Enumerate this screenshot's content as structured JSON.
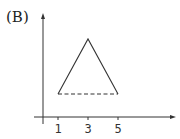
{
  "figure": {
    "label": "(B)",
    "colors": {
      "stroke": "#333333",
      "background": "#ffffff"
    }
  },
  "axes": {
    "x_ticks": [
      {
        "value": 1,
        "label": "1"
      },
      {
        "value": 3,
        "label": "3"
      },
      {
        "value": 5,
        "label": "5"
      }
    ],
    "x_axis_arrow": true,
    "y_axis_arrow": true,
    "y_ticks": []
  },
  "shape": {
    "type": "triangle",
    "vertices": [
      {
        "x": 1,
        "y": "base"
      },
      {
        "x": 3,
        "y": "apex"
      },
      {
        "x": 5,
        "y": "base"
      }
    ],
    "solid_edges": [
      "left side (1 to 3)",
      "right side (3 to 5)"
    ],
    "dashed_edges": [
      "base (1 to 5)"
    ]
  }
}
